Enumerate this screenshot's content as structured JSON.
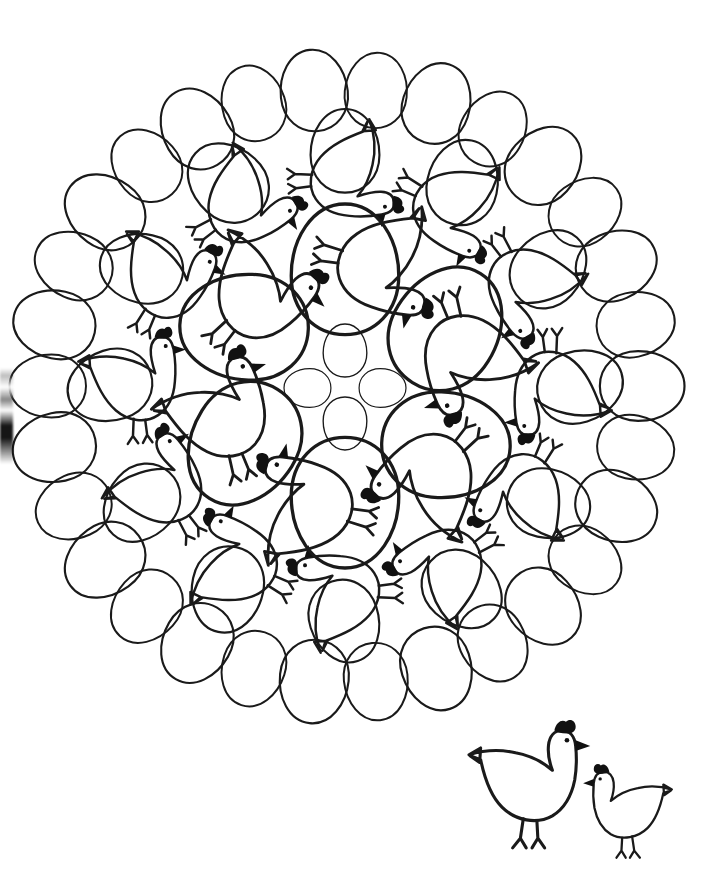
{
  "page": {
    "background_color": "#ffffff",
    "ink_color": "#1a1a1a",
    "width": 704,
    "height": 873
  },
  "artwork": {
    "type": "line-art-mandala",
    "subject": "hens and eggs",
    "style": "black outline on white, coloring book page",
    "mandala": {
      "name": "egg-and-hen-mandala",
      "center_x": 345,
      "center_y": 386,
      "radius": 332,
      "symmetry": 12,
      "stroke_width": 2.6,
      "rings": [
        {
          "name": "outer-egg-ring",
          "description": "ring of 30 plain eggs forming the circular border",
          "count": 30,
          "radius": 298,
          "egg_rx": 32,
          "egg_ry": 40,
          "rotation_offset": 6
        },
        {
          "name": "outer-hen-ring",
          "description": "ring of 12 hens, each head pointing clockwise, tails toward centre",
          "count": 12,
          "radius": 214,
          "hen_scale": 1.0,
          "rotation_offset": 15
        },
        {
          "name": "mid-egg-ring",
          "description": "ring of 12 medium eggs filling gaps between outer hens",
          "count": 12,
          "radius": 196,
          "egg_rx": 33,
          "egg_ry": 45,
          "rotation_offset": 0
        },
        {
          "name": "inner-hen-ring",
          "description": "ring of 6 larger hens around the core",
          "count": 6,
          "radius": 120,
          "hen_scale": 1.25,
          "rotation_offset": 30
        },
        {
          "name": "inner-large-egg-ring",
          "description": "ring of 6 large tilted eggs around the rosette core",
          "count": 6,
          "radius": 118,
          "egg_rx": 52,
          "egg_ry": 68,
          "rotation_offset": 0
        },
        {
          "name": "core-rosette",
          "description": "four small eggs arranged in a cross at the centre",
          "count": 4,
          "radius": 34,
          "egg_rx": 19,
          "egg_ry": 27
        }
      ]
    },
    "hen_motif": {
      "name": "hen",
      "parts": [
        "comb",
        "beak",
        "eye",
        "head",
        "neck",
        "body",
        "tail",
        "two-legs",
        "splayed-feet"
      ],
      "comb_fill": "#111111",
      "beak_fill": "#111111",
      "eye_fill": "#111111"
    },
    "egg_motif": {
      "name": "egg",
      "description": "oval, wider at the bottom, unfilled"
    }
  },
  "corner_hens": {
    "name": "hen-pair-vignette",
    "caption": "",
    "items": [
      {
        "name": "large-hen",
        "facing": "right",
        "x": 478,
        "y": 716,
        "scale": 1.0,
        "description": "large hen standing, facing right, pointed tail at upper-left"
      },
      {
        "name": "small-hen",
        "facing": "left",
        "x": 575,
        "y": 752,
        "scale": 0.72,
        "description": "smaller hen standing, facing left, pointed tail at upper-right"
      }
    ]
  },
  "artifacts": {
    "left_edge_smudge": {
      "name": "scan-edge-smudge",
      "description": "dark scanning artifact along the left paper edge",
      "x": 0,
      "y": 368,
      "width": 13,
      "height": 96
    }
  }
}
